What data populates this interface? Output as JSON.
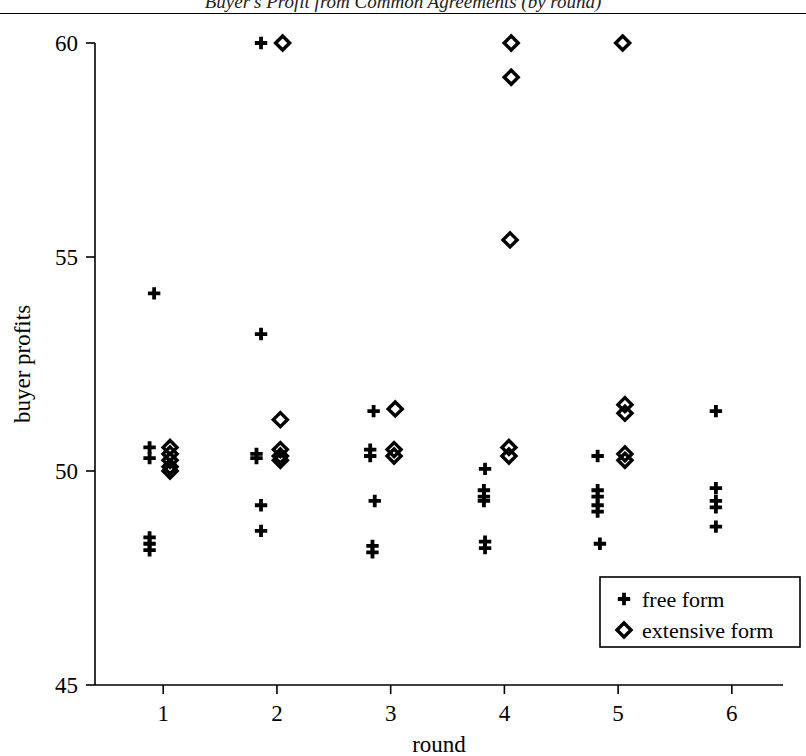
{
  "figure": {
    "title": "Buyer's Profit from Common Agreements (by round)",
    "title_clipped": true
  },
  "chart_data": {
    "type": "scatter",
    "title": "Buyer's Profit from Common Agreements (by round)",
    "xlabel": "round",
    "ylabel": "buyer profits",
    "xlim": [
      0.4,
      6.45
    ],
    "ylim": [
      45,
      60
    ],
    "xticks": [
      1,
      2,
      3,
      4,
      5,
      6
    ],
    "xtick_labels": [
      "1",
      "2",
      "3",
      "4",
      "5",
      "6"
    ],
    "yticks": [
      45,
      50,
      55,
      60
    ],
    "ytick_labels": [
      "45",
      "50",
      "55",
      "60"
    ],
    "grid": false,
    "legend_position": "lower right",
    "series": [
      {
        "name": "free form",
        "marker": "plus",
        "color": "#000000",
        "points": [
          [
            0.92,
            54.15
          ],
          [
            0.88,
            50.55
          ],
          [
            0.88,
            50.3
          ],
          [
            0.88,
            48.45
          ],
          [
            0.88,
            48.3
          ],
          [
            0.88,
            48.15
          ],
          [
            1.86,
            60.0
          ],
          [
            1.86,
            53.2
          ],
          [
            1.82,
            50.4
          ],
          [
            1.82,
            50.3
          ],
          [
            1.86,
            49.2
          ],
          [
            1.86,
            48.6
          ],
          [
            2.85,
            51.4
          ],
          [
            2.82,
            50.5
          ],
          [
            2.82,
            50.35
          ],
          [
            2.86,
            49.3
          ],
          [
            2.84,
            48.25
          ],
          [
            2.84,
            48.1
          ],
          [
            3.83,
            50.05
          ],
          [
            3.82,
            49.55
          ],
          [
            3.82,
            49.4
          ],
          [
            3.82,
            49.3
          ],
          [
            3.83,
            48.35
          ],
          [
            3.83,
            48.2
          ],
          [
            4.82,
            50.35
          ],
          [
            4.82,
            49.55
          ],
          [
            4.82,
            49.4
          ],
          [
            4.82,
            49.2
          ],
          [
            4.82,
            49.05
          ],
          [
            4.84,
            48.3
          ],
          [
            5.86,
            51.4
          ],
          [
            5.86,
            49.6
          ],
          [
            5.86,
            49.3
          ],
          [
            5.86,
            49.15
          ],
          [
            5.86,
            48.7
          ]
        ]
      },
      {
        "name": "extensive form",
        "marker": "diamond",
        "color": "#000000",
        "points": [
          [
            1.06,
            50.55
          ],
          [
            1.06,
            50.4
          ],
          [
            1.06,
            50.25
          ],
          [
            1.06,
            50.1
          ],
          [
            1.06,
            50.0
          ],
          [
            2.05,
            60.0
          ],
          [
            2.03,
            51.2
          ],
          [
            2.03,
            50.5
          ],
          [
            2.03,
            50.35
          ],
          [
            2.03,
            50.25
          ],
          [
            3.04,
            51.45
          ],
          [
            3.03,
            50.5
          ],
          [
            3.03,
            50.35
          ],
          [
            4.06,
            60.0
          ],
          [
            4.06,
            59.2
          ],
          [
            4.05,
            55.4
          ],
          [
            4.04,
            50.55
          ],
          [
            4.04,
            50.35
          ],
          [
            5.04,
            60.0
          ],
          [
            5.06,
            51.55
          ],
          [
            5.06,
            51.35
          ],
          [
            5.06,
            50.4
          ],
          [
            5.06,
            50.25
          ]
        ]
      }
    ]
  },
  "legend": {
    "items": [
      {
        "marker": "+",
        "label": "free form"
      },
      {
        "marker": "◆",
        "label": "extensive form"
      }
    ]
  }
}
